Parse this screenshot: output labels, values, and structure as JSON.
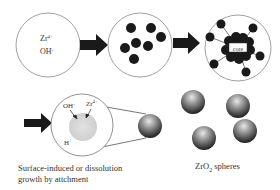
{
  "stages": {
    "stage1": {
      "ion1": "Zr",
      "ion1_sup": "4+",
      "ion2": "OH",
      "ion2_sup": "-"
    },
    "stage3": {
      "core_label": "core"
    },
    "stage4": {
      "ion_oh": "OH",
      "ion_oh_sup": "-",
      "ion_zr": "Zr",
      "ion_zr_sup": "4+",
      "ion_h": "H",
      "ion_h_sup": "+"
    }
  },
  "captions": {
    "growth_line1": "Surface-induced or dissolution",
    "growth_line2": "growth by attchment",
    "spheres_prefix": "ZrO",
    "spheres_sub": "2",
    "spheres_suffix": " spheres"
  },
  "colors": {
    "outline": "#888888",
    "particle": "#1a1a1a",
    "arrow": "#1a1a1a",
    "seed": "#d6d6d6"
  }
}
